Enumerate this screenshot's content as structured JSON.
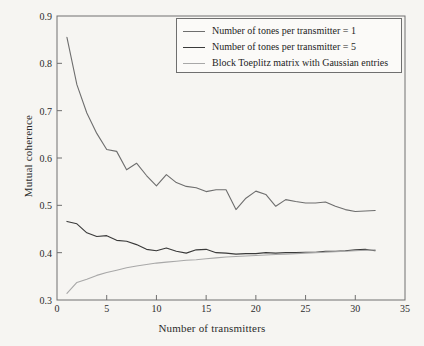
{
  "chart_data": {
    "type": "line",
    "title": "",
    "xlabel": "Number of transmitters",
    "ylabel": "Mutual coherence",
    "xlim": [
      0,
      35
    ],
    "ylim": [
      0.3,
      0.9
    ],
    "xticks": [
      0,
      5,
      10,
      15,
      20,
      25,
      30,
      35
    ],
    "yticks": [
      "0.3",
      "0.4",
      "0.5",
      "0.6",
      "0.7",
      "0.8",
      "0.9"
    ],
    "grid": false,
    "legend_position": "top-right-inside",
    "x": [
      1,
      2,
      3,
      4,
      5,
      6,
      7,
      8,
      9,
      10,
      11,
      12,
      13,
      14,
      15,
      16,
      17,
      18,
      19,
      20,
      21,
      22,
      23,
      24,
      25,
      26,
      27,
      28,
      29,
      30,
      31,
      32
    ],
    "series": [
      {
        "name": "Number of tones per transmitter = 1",
        "color": "#6e6e6e",
        "values": [
          0.855,
          0.755,
          0.695,
          0.652,
          0.618,
          0.614,
          0.575,
          0.589,
          0.563,
          0.541,
          0.565,
          0.548,
          0.54,
          0.537,
          0.529,
          0.533,
          0.533,
          0.491,
          0.515,
          0.53,
          0.523,
          0.498,
          0.512,
          0.508,
          0.505,
          0.505,
          0.507,
          0.498,
          0.491,
          0.487,
          0.488,
          0.489
        ]
      },
      {
        "name": "Number of tones per transmitter = 5",
        "color": "#3a3a3a",
        "values": [
          0.466,
          0.461,
          0.442,
          0.434,
          0.436,
          0.426,
          0.424,
          0.417,
          0.407,
          0.404,
          0.41,
          0.403,
          0.399,
          0.406,
          0.407,
          0.4,
          0.399,
          0.397,
          0.398,
          0.398,
          0.4,
          0.399,
          0.4,
          0.4,
          0.401,
          0.401,
          0.403,
          0.403,
          0.404,
          0.406,
          0.407,
          0.404
        ]
      },
      {
        "name": "Block Toeplitz matrix with Gaussian entries",
        "color": "#a8a8a8",
        "values": [
          0.314,
          0.337,
          0.344,
          0.352,
          0.358,
          0.363,
          0.368,
          0.372,
          0.375,
          0.378,
          0.38,
          0.382,
          0.384,
          0.385,
          0.387,
          0.389,
          0.391,
          0.392,
          0.393,
          0.394,
          0.395,
          0.396,
          0.397,
          0.398,
          0.399,
          0.4,
          0.401,
          0.402,
          0.403,
          0.404,
          0.405,
          0.406
        ]
      }
    ]
  },
  "legend": {
    "entries": [
      {
        "label": "Number of tones per transmitter = 1"
      },
      {
        "label": "Number of tones per transmitter = 5"
      },
      {
        "label": "Block Toeplitz matrix with Gaussian entries"
      }
    ]
  },
  "colors": {
    "background": "#f6f5f2",
    "axis": "#707070",
    "text": "#2b2b2b"
  }
}
